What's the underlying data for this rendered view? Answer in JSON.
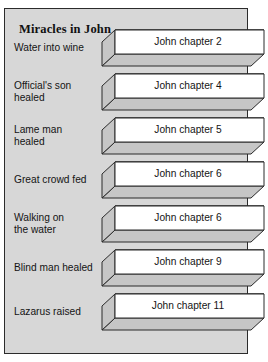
{
  "chart": {
    "title": "Miracles in John"
  },
  "chart_data": {
    "type": "bar",
    "title": "Miracles in John",
    "xlabel": "",
    "ylabel": "",
    "orientation": "horizontal",
    "style": "3d-isometric",
    "grid": false,
    "legend": false,
    "categories": [
      "Water into wine",
      "Official's son healed",
      "Lame man healed",
      "Great crowd fed",
      "Walking on the water",
      "Blind man healed",
      "Lazarus raised"
    ],
    "value_labels": [
      "John chapter 2",
      "John chapter 4",
      "John chapter 5",
      "John chapter 6",
      "John chapter 6",
      "John chapter 9",
      "John chapter 11"
    ],
    "values": [
      2,
      4,
      5,
      6,
      6,
      9,
      11
    ],
    "colors": {
      "panel_background": "#d7d7d7",
      "panel_border": "#2b2b2b",
      "bar_front": "#ffffff",
      "bar_side": "#c6c6c6",
      "bar_top": "#e8e8e8",
      "bar_outline": "#2b2b2b",
      "text": "#141414"
    }
  },
  "rows": [
    {
      "label": "Water into wine",
      "value_label": "John chapter 2"
    },
    {
      "label": "Official's son\nhealed",
      "value_label": "John chapter 4"
    },
    {
      "label": "Lame man\nhealed",
      "value_label": "John chapter 5"
    },
    {
      "label": "Great crowd fed",
      "value_label": "John chapter 6"
    },
    {
      "label": "Walking on\nthe water",
      "value_label": "John chapter 6"
    },
    {
      "label": "Blind man healed",
      "value_label": "John chapter 9"
    },
    {
      "label": "Lazarus raised",
      "value_label": "John chapter 11"
    }
  ]
}
